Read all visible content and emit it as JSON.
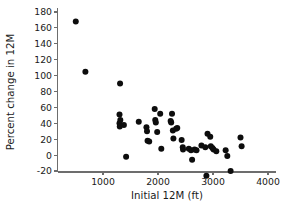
{
  "chart_data": {
    "type": "scatter",
    "title": "",
    "xlabel": "Initial 12M (ft)",
    "ylabel": "Percent change in 12M",
    "xlim": [
      0,
      4150
    ],
    "ylim": [
      -32,
      185
    ],
    "xticks": [
      1000,
      2000,
      3000,
      4000
    ],
    "xticklabels": [
      "1000",
      "2000",
      "3000",
      "4000"
    ],
    "yticks": [
      -20,
      0,
      20,
      40,
      60,
      80,
      100,
      120,
      140,
      160,
      180
    ],
    "yticklabels": [
      "-20",
      "0",
      "20",
      "40",
      "60",
      "80",
      "100",
      "120",
      "140",
      "160",
      "180"
    ],
    "grid": false,
    "legend": null,
    "marker": "filled-circle",
    "marker_color": "#0d0d0d",
    "marker_size_px": 3.0,
    "n_points": 48,
    "points": [
      {
        "x": 505,
        "y": 168
      },
      {
        "x": 680,
        "y": 105
      },
      {
        "x": 1310,
        "y": 90
      },
      {
        "x": 1300,
        "y": 51
      },
      {
        "x": 1315,
        "y": 44
      },
      {
        "x": 1300,
        "y": 40
      },
      {
        "x": 1305,
        "y": 36
      },
      {
        "x": 1380,
        "y": 38
      },
      {
        "x": 1420,
        "y": -2
      },
      {
        "x": 1650,
        "y": 42
      },
      {
        "x": 1790,
        "y": 35
      },
      {
        "x": 1800,
        "y": 30
      },
      {
        "x": 1810,
        "y": 18
      },
      {
        "x": 1840,
        "y": 17
      },
      {
        "x": 1940,
        "y": 58
      },
      {
        "x": 1950,
        "y": 44
      },
      {
        "x": 1960,
        "y": 41
      },
      {
        "x": 1985,
        "y": 29
      },
      {
        "x": 2040,
        "y": 52
      },
      {
        "x": 2060,
        "y": 8
      },
      {
        "x": 2230,
        "y": 43
      },
      {
        "x": 2240,
        "y": 41
      },
      {
        "x": 2255,
        "y": 52
      },
      {
        "x": 2270,
        "y": 31
      },
      {
        "x": 2280,
        "y": 21
      },
      {
        "x": 2330,
        "y": 33
      },
      {
        "x": 2350,
        "y": 34
      },
      {
        "x": 2430,
        "y": 19
      },
      {
        "x": 2450,
        "y": 10
      },
      {
        "x": 2455,
        "y": 7
      },
      {
        "x": 2560,
        "y": 8
      },
      {
        "x": 2600,
        "y": 6
      },
      {
        "x": 2620,
        "y": -6
      },
      {
        "x": 2665,
        "y": 7
      },
      {
        "x": 2700,
        "y": 6
      },
      {
        "x": 2790,
        "y": 12
      },
      {
        "x": 2860,
        "y": 10
      },
      {
        "x": 2880,
        "y": -26
      },
      {
        "x": 2900,
        "y": 27
      },
      {
        "x": 2950,
        "y": 23
      },
      {
        "x": 2960,
        "y": 11
      },
      {
        "x": 2990,
        "y": 9
      },
      {
        "x": 3010,
        "y": 7
      },
      {
        "x": 3060,
        "y": 5
      },
      {
        "x": 3230,
        "y": 6
      },
      {
        "x": 3260,
        "y": -1
      },
      {
        "x": 3320,
        "y": -20
      },
      {
        "x": 3500,
        "y": 22
      },
      {
        "x": 3520,
        "y": 11
      }
    ]
  },
  "axes": {
    "x_axis_name": "initial-12m-axis",
    "y_axis_name": "percent-change-axis"
  }
}
